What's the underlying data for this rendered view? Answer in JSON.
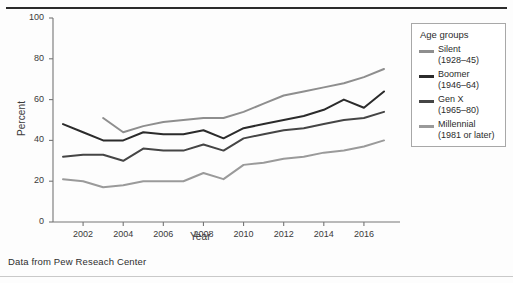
{
  "caption": "Data from Pew Reseach Center",
  "legend": {
    "title": "Age groups",
    "entries": [
      {
        "name": "Silent",
        "years": "(1928–45)",
        "color": "#8e8e8e"
      },
      {
        "name": "Boomer",
        "years": "(1946–64)",
        "color": "#2b2b2b"
      },
      {
        "name": "Gen X",
        "years": "(1965–80)",
        "color": "#454545"
      },
      {
        "name": "Millennial",
        "years": "(1981 or later)",
        "color": "#9a9a9a"
      }
    ]
  },
  "chart_data": {
    "type": "line",
    "title": "",
    "xlabel": "Year",
    "ylabel": "Percent",
    "xlim": [
      2000.5,
      2017.3
    ],
    "ylim": [
      0,
      100
    ],
    "yticks": [
      0,
      20,
      40,
      60,
      80,
      100
    ],
    "xticks": [
      2002,
      2004,
      2006,
      2008,
      2010,
      2012,
      2014,
      2016
    ],
    "grid": false,
    "legend_position": "right-outside",
    "x": [
      2001,
      2002,
      2003,
      2004,
      2005,
      2006,
      2007,
      2008,
      2009,
      2010,
      2011,
      2012,
      2013,
      2014,
      2015,
      2016,
      2017
    ],
    "series": [
      {
        "name": "Silent",
        "label": "Silent (1928–45)",
        "color": "#8e8e8e",
        "x": [
          2003,
          2004,
          2005,
          2006,
          2007,
          2008,
          2009,
          2010,
          2011,
          2012,
          2013,
          2014,
          2015,
          2016,
          2017
        ],
        "values": [
          51,
          44,
          47,
          49,
          50,
          51,
          51,
          54,
          58,
          62,
          64,
          66,
          68,
          71,
          75
        ]
      },
      {
        "name": "Boomer",
        "label": "Boomer (1946–64)",
        "color": "#2b2b2b",
        "x": [
          2001,
          2002,
          2003,
          2004,
          2005,
          2006,
          2007,
          2008,
          2009,
          2010,
          2011,
          2012,
          2013,
          2014,
          2015,
          2016,
          2017
        ],
        "values": [
          48,
          44,
          40,
          40,
          44,
          43,
          43,
          45,
          41,
          46,
          48,
          50,
          52,
          55,
          60,
          56,
          64
        ]
      },
      {
        "name": "Gen X",
        "label": "Gen X (1965–80)",
        "color": "#454545",
        "x": [
          2001,
          2002,
          2003,
          2004,
          2005,
          2006,
          2007,
          2008,
          2009,
          2010,
          2011,
          2012,
          2013,
          2014,
          2015,
          2016,
          2017
        ],
        "values": [
          32,
          33,
          33,
          30,
          36,
          35,
          35,
          38,
          35,
          41,
          43,
          45,
          46,
          48,
          50,
          51,
          54
        ]
      },
      {
        "name": "Millennial",
        "label": "Millennial (1981 or later)",
        "color": "#9a9a9a",
        "x": [
          2001,
          2002,
          2003,
          2004,
          2005,
          2006,
          2007,
          2008,
          2009,
          2010,
          2011,
          2012,
          2013,
          2014,
          2015,
          2016,
          2017
        ],
        "values": [
          21,
          20,
          17,
          18,
          20,
          20,
          20,
          24,
          21,
          28,
          29,
          31,
          32,
          34,
          35,
          37,
          40
        ]
      }
    ]
  }
}
